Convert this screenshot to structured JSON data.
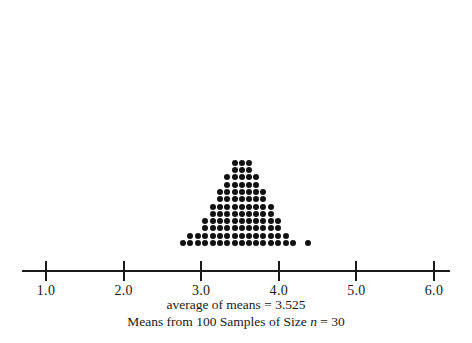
{
  "figure": {
    "caption_line1": "average of means = 3.525",
    "caption_line2_pre": "Means from 100 Samples of Size ",
    "caption_line2_ital": "n",
    "caption_line2_post": " = 30",
    "dot_color": "#111111",
    "axis_color": "#1a1a1a"
  },
  "axis": {
    "ticks": [
      {
        "value": 1.0,
        "label": "1.0"
      },
      {
        "value": 2.0,
        "label": "2.0"
      },
      {
        "value": 3.0,
        "label": "3.0"
      },
      {
        "value": 4.0,
        "label": "4.0"
      },
      {
        "value": 5.0,
        "label": "5.0"
      },
      {
        "value": 6.0,
        "label": "6.0"
      }
    ],
    "min": 1.0,
    "max": 6.0
  },
  "chart_data": {
    "type": "scatter",
    "plot_style": "dotplot",
    "title": "",
    "subtitle": "Means from 100 Samples of Size n = 30",
    "annotation": "average of means = 3.525",
    "xlabel": "",
    "ylabel": "",
    "xlim": [
      1.0,
      6.0
    ],
    "grid": false,
    "legend": null,
    "mean_of_means": 3.525,
    "sample_count": 100,
    "sample_size": 30,
    "dot_spacing_units": 0.0935,
    "bin_values": [
      2.77,
      2.86,
      2.96,
      3.05,
      3.15,
      3.24,
      3.33,
      3.43,
      3.52,
      3.62,
      3.71,
      3.8,
      3.9,
      3.99,
      4.09,
      4.18,
      4.27,
      4.37
    ],
    "bin_counts": [
      1,
      2,
      2,
      4,
      6,
      8,
      10,
      12,
      12,
      12,
      10,
      8,
      6,
      4,
      2,
      1,
      0,
      1
    ],
    "columns": [
      {
        "x": 2.77,
        "count": 1
      },
      {
        "x": 2.86,
        "count": 2
      },
      {
        "x": 2.96,
        "count": 2
      },
      {
        "x": 3.05,
        "count": 4
      },
      {
        "x": 3.15,
        "count": 6
      },
      {
        "x": 3.24,
        "count": 8
      },
      {
        "x": 3.33,
        "count": 10
      },
      {
        "x": 3.43,
        "count": 12
      },
      {
        "x": 3.52,
        "count": 12
      },
      {
        "x": 3.62,
        "count": 12
      },
      {
        "x": 3.71,
        "count": 10
      },
      {
        "x": 3.8,
        "count": 8
      },
      {
        "x": 3.9,
        "count": 6
      },
      {
        "x": 3.99,
        "count": 4
      },
      {
        "x": 4.09,
        "count": 2
      },
      {
        "x": 4.18,
        "count": 1
      },
      {
        "x": 4.37,
        "count": 1
      }
    ]
  }
}
